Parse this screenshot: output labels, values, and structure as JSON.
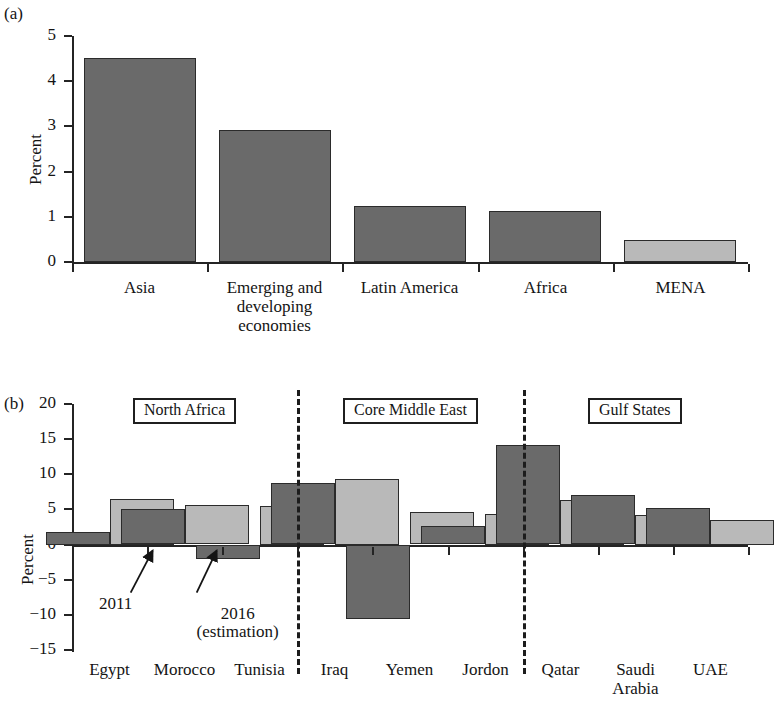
{
  "figure": {
    "panels": [
      {
        "tag": "(a)",
        "ylabel": "Percent",
        "yticks": [
          "0",
          "1",
          "2",
          "3",
          "4",
          "5"
        ]
      },
      {
        "tag": "(b)",
        "ylabel": "Percent",
        "yticks": [
          "−15",
          "−10",
          "−5",
          "0",
          "5",
          "10",
          "15",
          "20"
        ],
        "group_labels": [
          "North Africa",
          "Core Middle East",
          "Gulf States"
        ],
        "annotations": [
          "2011",
          "2016",
          "(estimation)"
        ]
      }
    ]
  },
  "colors": {
    "bar_dark": "#6a6a6a",
    "bar_light": "#b9b9b9",
    "bar_edge": "#2b2b2b",
    "axis": "#242424",
    "text": "#141414"
  },
  "chart_data": [
    {
      "type": "bar",
      "panel": "(a)",
      "title": "",
      "xlabel": "",
      "ylabel": "Percent",
      "ylim": [
        0,
        5
      ],
      "ytick_values": [
        0,
        1,
        2,
        3,
        4,
        5
      ],
      "grid": false,
      "legend": "none",
      "categories": [
        "Asia",
        "Emerging and developing economies",
        "Latin America",
        "Africa",
        "MENA"
      ],
      "category_lines": [
        [
          "Asia"
        ],
        [
          "Emerging and",
          "developing",
          "economies"
        ],
        [
          "Latin America"
        ],
        [
          "Africa"
        ],
        [
          "MENA"
        ]
      ],
      "values": [
        4.51,
        2.93,
        1.24,
        1.12,
        0.48
      ],
      "bar_shades": [
        "dark",
        "dark",
        "dark",
        "dark",
        "light"
      ]
    },
    {
      "type": "bar",
      "panel": "(b)",
      "title": "",
      "xlabel": "",
      "ylabel": "Percent",
      "ylim": [
        -15,
        20
      ],
      "ytick_values": [
        -15,
        -10,
        -5,
        0,
        5,
        10,
        15,
        20
      ],
      "grid": false,
      "legend": "annotated arrows (2011, 2016 (estimation))",
      "categories": [
        "Egypt",
        "Morocco",
        "Tunisia",
        "Iraq",
        "Yemen",
        "Jordon",
        "Qatar",
        "Saudi Arabia",
        "UAE"
      ],
      "category_lines": [
        [
          "Egypt"
        ],
        [
          "Morocco"
        ],
        [
          "Tunisia"
        ],
        [
          "Iraq"
        ],
        [
          "Yemen"
        ],
        [
          "Jordon"
        ],
        [
          "Qatar"
        ],
        [
          "Saudi",
          "Arabia"
        ],
        [
          "UAE"
        ]
      ],
      "series": [
        {
          "name": "2011",
          "shade": "dark",
          "values": [
            1.8,
            5.0,
            -2.0,
            8.7,
            -10.5,
            2.6,
            14.1,
            7.0,
            5.2
          ]
        },
        {
          "name": "2016 (estimation)",
          "shade": "light",
          "values": [
            6.5,
            5.6,
            5.5,
            9.4,
            4.6,
            4.4,
            6.4,
            4.2,
            3.5
          ]
        }
      ],
      "groups": [
        {
          "label": "North Africa",
          "categories": [
            "Egypt",
            "Morocco",
            "Tunisia"
          ]
        },
        {
          "label": "Core Middle East",
          "categories": [
            "Iraq",
            "Yemen",
            "Jordon"
          ]
        },
        {
          "label": "Gulf States",
          "categories": [
            "Qatar",
            "Saudi Arabia",
            "UAE"
          ]
        }
      ]
    }
  ]
}
